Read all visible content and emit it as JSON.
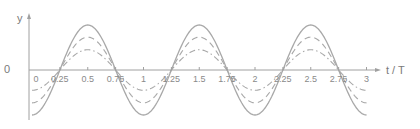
{
  "chart_data": {
    "type": "line",
    "title": "",
    "xlabel": "t / T",
    "ylabel": "y",
    "y_zero_label": "0",
    "xlim": [
      0,
      3
    ],
    "x_ticks": [
      0,
      0.25,
      0.5,
      0.75,
      1,
      1.25,
      1.5,
      1.75,
      2,
      2.25,
      2.5,
      2.75,
      3
    ],
    "x_tick_labels": [
      "0",
      "0.25",
      "0.5",
      "0.75",
      "1",
      "1.25",
      "1.5",
      "1.75",
      "2",
      "2.25",
      "2.5",
      "2.75",
      "3"
    ],
    "grid": false,
    "legend": null,
    "series": [
      {
        "name": "solid",
        "style": "solid",
        "function": "-A*cos(2*pi*t)",
        "amplitude": 1.0,
        "color": "#a8a8a8"
      },
      {
        "name": "dashed",
        "style": "dashed",
        "function": "-A*cos(2*pi*t)",
        "amplitude": 0.73,
        "color": "#a8a8a8"
      },
      {
        "name": "dash-dot",
        "style": "dashdot",
        "function": "-A*cos(2*pi*t)",
        "amplitude": 0.45,
        "color": "#a8a8a8"
      }
    ]
  },
  "colors": {
    "axis": "#a0a0a0",
    "curve": "#a8a8a8",
    "text": "#808080"
  }
}
